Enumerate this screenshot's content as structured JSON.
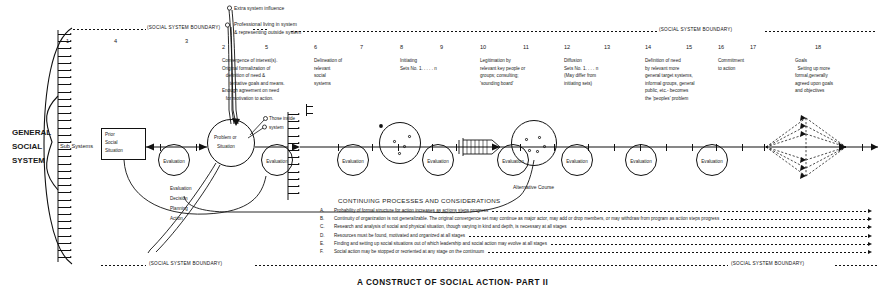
{
  "figure": {
    "caption": "A CONSTRUCT OF SOCIAL ACTION- PART II",
    "boundary_label": "(SOCIAL SYSTEM BOUNDARY)",
    "system_label_line1": "GENERAL",
    "system_label_line2": "SOCIAL",
    "system_label_line3": "SYSTEM",
    "sub_systems_label": "Sub Systems"
  },
  "callouts": {
    "extra_system": "Extra system influence",
    "professional_l1": "Professional living in system",
    "professional_l2": "& representing outside system",
    "those_inside_l1": "Those inside",
    "those_inside_l2": "system",
    "alternative_course": "Alternative Course"
  },
  "nodes": {
    "prior_situation_l1": "Prior",
    "prior_situation_l2": "Social",
    "prior_situation_l3": "Situation",
    "problem_l1": "Problem or",
    "problem_l2": "Situation",
    "evaluation": "Evaluation",
    "edpa": [
      "Evaluation",
      "Decision",
      "Planning",
      "Action"
    ]
  },
  "stage_numbers_upper": [
    {
      "n": "1",
      "x": 66
    },
    {
      "n": "4",
      "x": 114
    },
    {
      "n": "3",
      "x": 185
    }
  ],
  "stage_numbers_lower": [
    {
      "n": "2",
      "x": 222
    },
    {
      "n": "5",
      "x": 265
    },
    {
      "n": "6",
      "x": 314
    },
    {
      "n": "7",
      "x": 360
    },
    {
      "n": "8",
      "x": 400
    },
    {
      "n": "9",
      "x": 440
    },
    {
      "n": "10",
      "x": 480
    },
    {
      "n": "11",
      "x": 523
    },
    {
      "n": "12",
      "x": 564
    },
    {
      "n": "13",
      "x": 604
    },
    {
      "n": "14",
      "x": 645
    },
    {
      "n": "15",
      "x": 686
    },
    {
      "n": "16",
      "x": 718
    },
    {
      "n": "17",
      "x": 750
    },
    {
      "n": "18",
      "x": 815
    }
  ],
  "stage_texts": [
    {
      "id": "convergence",
      "x": 222,
      "y": 57,
      "lines": [
        "Convergence of interest(s).",
        "Original formalization of",
        "   definition of need &",
        "      tentative goals and means.",
        "Enough agreement on need",
        "   for motivation to action."
      ]
    },
    {
      "id": "delineation",
      "x": 314,
      "y": 57,
      "lines": [
        "Delineation of",
        "relevant",
        "social",
        "systems"
      ]
    },
    {
      "id": "initiating",
      "x": 400,
      "y": 57,
      "lines": [
        "Initiating",
        "Sets No. 1. . . . . n"
      ]
    },
    {
      "id": "legitimation",
      "x": 480,
      "y": 57,
      "lines": [
        "Legitimation by",
        "relevant key people or",
        "groups; consulting;",
        "'sounding board'"
      ]
    },
    {
      "id": "diffusion",
      "x": 564,
      "y": 57,
      "lines": [
        "Diffusion",
        "Sets No. 1. . . . n",
        "(May differ from",
        "initiating sets)"
      ]
    },
    {
      "id": "definition-of-need",
      "x": 645,
      "y": 57,
      "lines": [
        "Definition of need",
        "by relevant more",
        "general target systems,",
        "informal groups, general",
        "public, etc.- becomes",
        "the 'peoples' problem"
      ]
    },
    {
      "id": "commitment",
      "x": 718,
      "y": 57,
      "lines": [
        "Commitment",
        "to action"
      ]
    },
    {
      "id": "goals",
      "x": 795,
      "y": 57,
      "lines": [
        "Goals",
        "  Setting up more",
        "formal,generally",
        "agreed upon goals",
        "and objectives"
      ]
    }
  ],
  "continuing": {
    "heading": "CONTINUING PROCESSES AND CONSIDERATIONS",
    "items": [
      {
        "letter": "A.",
        "text": "Probability of formal structure for action increases as actions steps progress"
      },
      {
        "letter": "B.",
        "text": "Continuity of organization is not generalizable. The original convergence set may continue as major actor, may add or drop members, or may withdraw from program as action steps progress"
      },
      {
        "letter": "C.",
        "text": "Research and analysis of social and physical situation, though varying in kind and depth, is necessary at all stages"
      },
      {
        "letter": "D.",
        "text": "Resources must be found, motivated and organized at all stages"
      },
      {
        "letter": "E.",
        "text": "Finding and setting up social situations out of which leadership and social action may evolve at all stages"
      },
      {
        "letter": "F.",
        "text": "Social action may be stopped or reoriented at any stage on the continuum"
      }
    ]
  },
  "colors": {
    "ink": "#111111",
    "paper": "#ffffff"
  }
}
